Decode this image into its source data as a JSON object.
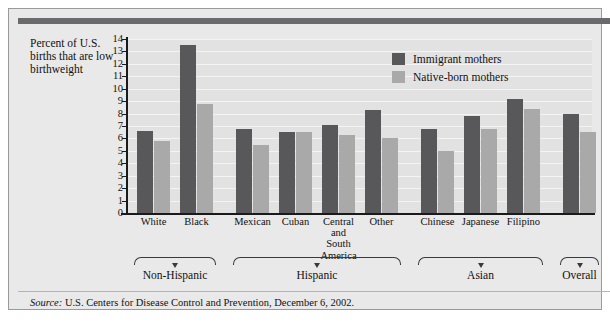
{
  "caption": "Percent of U.S. births that are low birthweight",
  "legend": {
    "immigrant": "Immigrant mothers",
    "native": "Native-born mothers"
  },
  "source": {
    "label": "Source:",
    "text": "U.S. Centers for Disease Control and Prevention, December 6, 2002."
  },
  "colors": {
    "immigrant_bar": "#58585a",
    "native_bar": "#a9a9a9",
    "plot_background": "#e2e2e2",
    "panel_background": "#e9e9e9",
    "top_band": "#6a6a6c",
    "axis": "#1a1a1a"
  },
  "groups": [
    {
      "label": "Non-Hispanic",
      "count": 2
    },
    {
      "label": "Hispanic",
      "count": 4
    },
    {
      "label": "Asian",
      "count": 3
    },
    {
      "label": "Overall",
      "count": 1
    }
  ],
  "chart_data": {
    "type": "bar",
    "title": "",
    "xlabel": "",
    "ylabel": "Percent of U.S. births that are low birthweight",
    "ylim": [
      0,
      14
    ],
    "yticks": [
      0,
      1,
      2,
      3,
      4,
      5,
      6,
      7,
      8,
      9,
      10,
      11,
      12,
      13,
      14
    ],
    "grid": true,
    "legend_position": "top-right",
    "categories": [
      "White",
      "Black",
      "Mexican",
      "Cuban",
      "Central and South America",
      "Other",
      "Chinese",
      "Japanese",
      "Filipino",
      ""
    ],
    "category_display": [
      "White",
      "Black",
      "Mexican",
      "Cuban",
      "Central<br>and<br>South<br>America",
      "Other",
      "Chinese",
      "Japanese",
      "Filipino",
      ""
    ],
    "series": [
      {
        "name": "Immigrant mothers",
        "color": "#58585a",
        "values": [
          6.6,
          13.5,
          6.8,
          6.5,
          7.1,
          8.3,
          6.8,
          7.8,
          9.2,
          8.0
        ]
      },
      {
        "name": "Native-born mothers",
        "color": "#a9a9a9",
        "values": [
          5.8,
          8.8,
          5.5,
          6.5,
          6.3,
          6.0,
          5.0,
          6.8,
          8.4,
          6.5
        ]
      }
    ]
  }
}
